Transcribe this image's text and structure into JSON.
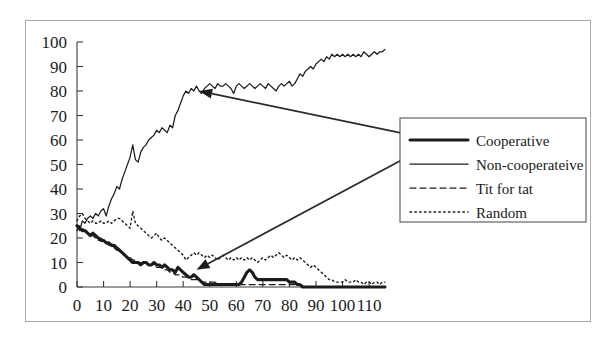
{
  "figure": {
    "frame": {
      "visible": true,
      "border_color": "#a9a9a9"
    }
  },
  "chart_data": {
    "type": "line",
    "title": "",
    "xlabel": "",
    "ylabel": "",
    "xlim": [
      0,
      116
    ],
    "ylim": [
      0,
      100
    ],
    "grid": false,
    "legend_position": "center-right",
    "xticks": [
      0,
      10,
      20,
      30,
      40,
      50,
      60,
      70,
      80,
      90,
      100,
      110
    ],
    "yticks": [
      0,
      10,
      20,
      30,
      40,
      50,
      60,
      70,
      80,
      90,
      100
    ],
    "xtick_labels": [
      "0",
      "10",
      "20",
      "30",
      "40",
      "50",
      "60",
      "70",
      "80",
      "90",
      "100",
      "110"
    ],
    "ytick_labels": [
      "0",
      "10",
      "20",
      "30",
      "40",
      "50",
      "60",
      "70",
      "80",
      "90",
      "100"
    ],
    "annotations": [
      {
        "text": "",
        "points_to": [
          46,
          80
        ],
        "from": [
          126,
          62
        ],
        "name": "arrow-to-non-cooperative"
      },
      {
        "text": "",
        "points_to": [
          45,
          7
        ],
        "from": [
          126,
          54
        ],
        "name": "arrow-to-cooperative"
      }
    ],
    "series": [
      {
        "name": "Cooperative",
        "style": "thick-solid",
        "x": [
          0,
          1,
          2,
          3,
          4,
          5,
          6,
          7,
          8,
          9,
          10,
          11,
          12,
          13,
          14,
          15,
          16,
          17,
          18,
          19,
          20,
          21,
          22,
          23,
          24,
          25,
          26,
          27,
          28,
          29,
          30,
          31,
          32,
          33,
          34,
          35,
          36,
          37,
          38,
          39,
          40,
          41,
          42,
          43,
          44,
          45,
          46,
          47,
          48,
          49,
          50,
          51,
          52,
          53,
          54,
          55,
          56,
          57,
          58,
          59,
          60,
          61,
          62,
          63,
          64,
          65,
          66,
          67,
          68,
          69,
          70,
          71,
          72,
          73,
          74,
          75,
          76,
          77,
          78,
          79,
          80,
          81,
          82,
          83,
          84,
          85,
          86,
          87,
          88,
          89,
          90,
          91,
          92,
          93,
          94,
          95,
          96,
          97,
          98,
          99,
          100,
          101,
          102,
          103,
          104,
          105,
          106,
          107,
          108,
          109,
          110,
          111,
          112,
          113,
          114,
          115,
          116
        ],
        "values": [
          25,
          24,
          23,
          23,
          22,
          21,
          22,
          21,
          20,
          19,
          19,
          18,
          18,
          17,
          17,
          16,
          15,
          14,
          13,
          12,
          11,
          10,
          10,
          10,
          9,
          10,
          10,
          9,
          9,
          10,
          9,
          9,
          8,
          9,
          8,
          7,
          7,
          6,
          8,
          7,
          6,
          5,
          4,
          4,
          5,
          4,
          3,
          2,
          1,
          1,
          1,
          1,
          1,
          1,
          1,
          1,
          1,
          1,
          1,
          1,
          1,
          1,
          2,
          4,
          6,
          7,
          6,
          4,
          3,
          3,
          3,
          3,
          3,
          3,
          3,
          3,
          3,
          3,
          3,
          3,
          2,
          2,
          2,
          1,
          1,
          0,
          0,
          0,
          0,
          0,
          0,
          0,
          0,
          0,
          0,
          0,
          0,
          0,
          0,
          0,
          0,
          0,
          0,
          0,
          0,
          0,
          0,
          0,
          0,
          0,
          0,
          0,
          0,
          0,
          0,
          0,
          0
        ]
      },
      {
        "name": "Non-cooperateive",
        "style": "thin-solid",
        "x": [
          0,
          1,
          2,
          3,
          4,
          5,
          6,
          7,
          8,
          9,
          10,
          11,
          12,
          13,
          14,
          15,
          16,
          17,
          18,
          19,
          20,
          21,
          22,
          23,
          24,
          25,
          26,
          27,
          28,
          29,
          30,
          31,
          32,
          33,
          34,
          35,
          36,
          37,
          38,
          39,
          40,
          41,
          42,
          43,
          44,
          45,
          46,
          47,
          48,
          49,
          50,
          51,
          52,
          53,
          54,
          55,
          56,
          57,
          58,
          59,
          60,
          61,
          62,
          63,
          64,
          65,
          66,
          67,
          68,
          69,
          70,
          71,
          72,
          73,
          74,
          75,
          76,
          77,
          78,
          79,
          80,
          81,
          82,
          83,
          84,
          85,
          86,
          87,
          88,
          89,
          90,
          91,
          92,
          93,
          94,
          95,
          96,
          97,
          98,
          99,
          100,
          101,
          102,
          103,
          104,
          105,
          106,
          107,
          108,
          109,
          110,
          111,
          112,
          113,
          114,
          115,
          116
        ],
        "values": [
          25,
          23,
          27,
          26,
          28,
          29,
          28,
          30,
          29,
          31,
          32,
          29,
          33,
          36,
          38,
          41,
          40,
          44,
          47,
          50,
          53,
          58,
          52,
          51,
          55,
          57,
          58,
          60,
          61,
          62,
          64,
          63,
          65,
          64,
          63,
          66,
          65,
          70,
          72,
          75,
          78,
          80,
          79,
          81,
          80,
          82,
          80,
          79,
          81,
          82,
          83,
          82,
          81,
          83,
          82,
          82,
          83,
          82,
          81,
          79,
          82,
          83,
          82,
          81,
          82,
          83,
          82,
          81,
          82,
          83,
          82,
          81,
          83,
          82,
          81,
          80,
          82,
          83,
          82,
          83,
          84,
          82,
          83,
          85,
          87,
          86,
          88,
          89,
          90,
          89,
          91,
          92,
          93,
          92,
          94,
          93,
          95,
          94,
          95,
          94,
          95,
          94,
          95,
          94,
          95,
          94,
          95,
          94,
          96,
          95,
          94,
          95,
          96,
          95,
          96,
          96,
          97
        ]
      },
      {
        "name": "Tit for tat",
        "style": "dashed",
        "x": [
          0,
          1,
          2,
          3,
          4,
          5,
          6,
          7,
          8,
          9,
          10,
          11,
          12,
          13,
          14,
          15,
          16,
          17,
          18,
          19,
          20,
          21,
          22,
          23,
          24,
          25,
          26,
          27,
          28,
          29,
          30,
          31,
          32,
          33,
          34,
          35,
          36,
          37,
          38,
          39,
          40,
          41,
          42,
          43,
          44,
          45,
          46,
          47,
          48,
          49,
          50,
          51,
          52,
          53,
          54,
          55,
          56,
          57,
          58,
          59,
          60,
          61,
          62,
          63,
          64,
          65,
          66,
          67,
          68,
          69,
          70,
          71,
          72,
          73,
          74,
          75,
          76,
          77,
          78,
          79,
          80,
          81,
          82,
          83,
          84,
          85,
          86,
          87,
          88,
          89,
          90,
          91,
          92,
          93,
          94,
          95,
          96,
          97,
          98,
          99,
          100,
          101,
          102,
          103,
          104,
          105,
          106,
          107,
          108,
          109,
          110,
          111,
          112,
          113,
          114,
          115,
          116
        ],
        "values": [
          23,
          25,
          24,
          23,
          22,
          21,
          21,
          20,
          19,
          20,
          19,
          18,
          17,
          17,
          16,
          15,
          15,
          14,
          13,
          12,
          12,
          11,
          11,
          10,
          10,
          10,
          10,
          9,
          9,
          9,
          8,
          8,
          8,
          7,
          7,
          6,
          6,
          5,
          5,
          5,
          4,
          4,
          4,
          3,
          3,
          3,
          3,
          2,
          2,
          2,
          2,
          2,
          2,
          1,
          1,
          1,
          1,
          1,
          1,
          1,
          1,
          1,
          1,
          1,
          1,
          1,
          1,
          1,
          1,
          1,
          1,
          1,
          1,
          1,
          1,
          1,
          1,
          1,
          1,
          1,
          1,
          1,
          1,
          1,
          1,
          0,
          0,
          0,
          0,
          0,
          0,
          0,
          0,
          0,
          0,
          0,
          0,
          0,
          0,
          0,
          0,
          0,
          0,
          0,
          0,
          0,
          0,
          0,
          0,
          0,
          0,
          0,
          0,
          0,
          0,
          0,
          0
        ]
      },
      {
        "name": "Random",
        "style": "dotted",
        "x": [
          0,
          1,
          2,
          3,
          4,
          5,
          6,
          7,
          8,
          9,
          10,
          11,
          12,
          13,
          14,
          15,
          16,
          17,
          18,
          19,
          20,
          21,
          22,
          23,
          24,
          25,
          26,
          27,
          28,
          29,
          30,
          31,
          32,
          33,
          34,
          35,
          36,
          37,
          38,
          39,
          40,
          41,
          42,
          43,
          44,
          45,
          46,
          47,
          48,
          49,
          50,
          51,
          52,
          53,
          54,
          55,
          56,
          57,
          58,
          59,
          60,
          61,
          62,
          63,
          64,
          65,
          66,
          67,
          68,
          69,
          70,
          71,
          72,
          73,
          74,
          75,
          76,
          77,
          78,
          79,
          80,
          81,
          82,
          83,
          84,
          85,
          86,
          87,
          88,
          89,
          90,
          91,
          92,
          93,
          94,
          95,
          96,
          97,
          98,
          99,
          100,
          101,
          102,
          103,
          104,
          105,
          106,
          107,
          108,
          109,
          110,
          111,
          112,
          113,
          114,
          115,
          116
        ],
        "values": [
          27,
          29,
          30,
          28,
          27,
          26,
          27,
          26,
          26,
          27,
          26,
          26,
          27,
          26,
          27,
          28,
          28,
          27,
          26,
          25,
          24,
          31,
          26,
          25,
          24,
          23,
          22,
          21,
          20,
          21,
          22,
          20,
          19,
          20,
          19,
          18,
          17,
          16,
          15,
          14,
          13,
          11,
          12,
          13,
          14,
          13,
          14,
          13,
          12,
          13,
          12,
          13,
          12,
          11,
          12,
          13,
          12,
          11,
          12,
          11,
          12,
          11,
          12,
          11,
          12,
          11,
          12,
          11,
          10,
          11,
          12,
          11,
          12,
          13,
          12,
          13,
          14,
          13,
          12,
          13,
          12,
          11,
          12,
          11,
          12,
          11,
          10,
          9,
          8,
          9,
          8,
          7,
          6,
          5,
          4,
          3,
          3,
          2,
          2,
          2,
          2,
          3,
          2,
          2,
          2,
          3,
          2,
          2,
          1,
          2,
          2,
          1,
          2,
          2,
          1,
          2,
          2
        ]
      }
    ]
  },
  "legend": {
    "entries": [
      {
        "label": "Cooperative",
        "style": "thick-solid"
      },
      {
        "label": "Non-cooperateive",
        "style": "thin-solid"
      },
      {
        "label": "Tit for tat",
        "style": "dashed"
      },
      {
        "label": "Random",
        "style": "dotted"
      }
    ]
  }
}
